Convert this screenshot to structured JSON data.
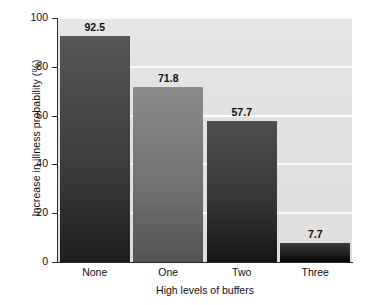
{
  "chart_data": {
    "type": "bar",
    "title": "",
    "subtitle": "",
    "categories": [
      "None",
      "One",
      "Two",
      "Three"
    ],
    "values": [
      92.5,
      71.8,
      57.7,
      7.7
    ],
    "value_labels": [
      "92.5",
      "71.8",
      "57.7",
      "7.7"
    ],
    "xlabel": "High levels of buffers",
    "ylabel": "Increase in illness probability (%)",
    "ylim": [
      0,
      100
    ],
    "xlim": [
      0,
      4
    ],
    "yticks": [
      0,
      20,
      40,
      60,
      80,
      100
    ],
    "ytick_labels": [
      "0",
      "20",
      "40",
      "60",
      "80",
      "100"
    ],
    "grid": "horizontal-only",
    "legend": "none",
    "annotations": [],
    "bar_colors": [
      "#565656",
      "#8b8b8b",
      "#4f4f4f",
      "#3a3a3a"
    ],
    "plot_background": "#e3e3e3",
    "gridline_color": "#fbfbfb",
    "axis_color": "#2b2b2b",
    "figure_background": "#ffffff"
  }
}
